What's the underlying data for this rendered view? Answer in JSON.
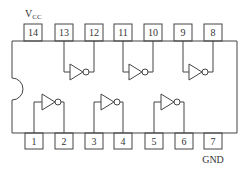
{
  "diagram": {
    "colors": {
      "stroke": "#444444",
      "text": "#333333",
      "background": "#ffffff"
    },
    "labels": {
      "vcc_main": "V",
      "vcc_sub": "CC",
      "gnd": "GND"
    },
    "top_pins": [
      {
        "number": "14",
        "x": 24
      },
      {
        "number": "13",
        "x": 55
      },
      {
        "number": "12",
        "x": 85
      },
      {
        "number": "11",
        "x": 114
      },
      {
        "number": "10",
        "x": 144
      },
      {
        "number": "9",
        "x": 174
      },
      {
        "number": "8",
        "x": 204
      }
    ],
    "bottom_pins": [
      {
        "number": "1",
        "x": 25
      },
      {
        "number": "2",
        "x": 55
      },
      {
        "number": "3",
        "x": 85
      },
      {
        "number": "4",
        "x": 114
      },
      {
        "number": "5",
        "x": 145
      },
      {
        "number": "6",
        "x": 175
      },
      {
        "number": "7",
        "x": 204
      }
    ],
    "gates": [
      {
        "type": "inverter",
        "input_pin": "13",
        "output_pin": "12"
      },
      {
        "type": "inverter",
        "input_pin": "11",
        "output_pin": "10"
      },
      {
        "type": "inverter",
        "input_pin": "9",
        "output_pin": "8"
      },
      {
        "type": "inverter",
        "input_pin": "1",
        "output_pin": "2"
      },
      {
        "type": "inverter",
        "input_pin": "3",
        "output_pin": "4"
      },
      {
        "type": "inverter",
        "input_pin": "5",
        "output_pin": "6"
      }
    ]
  }
}
